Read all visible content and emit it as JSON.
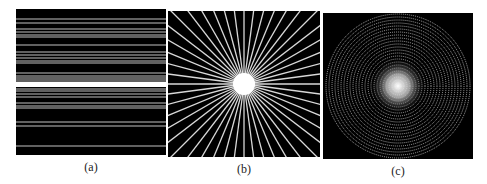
{
  "figure": {
    "panels": [
      {
        "id": "a",
        "caption": "(a)",
        "description": "horizontal parallel lines",
        "x": 16,
        "y": 9,
        "w": 150,
        "h": 146
      },
      {
        "id": "b",
        "caption": "(b)",
        "description": "radial star of lines with bright center",
        "x": 168,
        "y": 11,
        "w": 152,
        "h": 146
      },
      {
        "id": "c",
        "caption": "(c)",
        "description": "concentric dotted rings / spiral with bright center",
        "x": 323,
        "y": 13,
        "w": 150,
        "h": 146
      }
    ],
    "panel_a_lines_y": [
      10,
      14,
      20,
      23,
      26,
      28,
      36,
      43,
      46,
      49,
      52,
      54,
      64,
      67,
      69,
      71,
      73,
      75,
      77,
      80,
      82,
      85,
      88,
      94,
      97,
      99,
      113,
      117,
      137
    ],
    "panel_a_bright_band_y": [
      73,
      78
    ],
    "panel_b_ray_count": 48,
    "panel_b_center": [
      76,
      73
    ],
    "panel_c_ring_count": 24,
    "panel_c_center": [
      75,
      73
    ],
    "colors": {
      "background": "#000000",
      "line": "#d8d8d8",
      "page": "#ffffff"
    }
  }
}
